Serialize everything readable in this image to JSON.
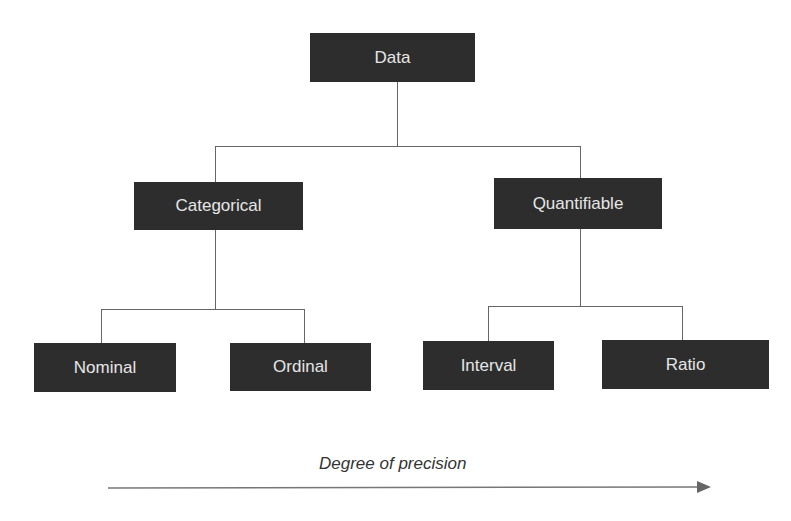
{
  "diagram": {
    "type": "tree",
    "root": {
      "label": "Data"
    },
    "level1": [
      {
        "label": "Categorical"
      },
      {
        "label": "Quantifiable"
      }
    ],
    "level2": [
      {
        "label": "Nominal",
        "parent": "Categorical"
      },
      {
        "label": "Ordinal",
        "parent": "Categorical"
      },
      {
        "label": "Interval",
        "parent": "Quantifiable"
      },
      {
        "label": "Ratio",
        "parent": "Quantifiable"
      }
    ],
    "axis": {
      "label": "Degree of precision",
      "direction": "left-to-right"
    }
  },
  "colors": {
    "node_fill": "#2d2d2d",
    "node_text": "#e6e6e6",
    "line": "#666666"
  }
}
